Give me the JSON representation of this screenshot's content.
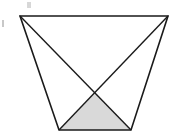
{
  "diagram": {
    "type": "trapezoid-with-diagonals",
    "vertices": {
      "top_left": [
        20,
        16
      ],
      "top_right": [
        168,
        16
      ],
      "bottom_right": [
        131,
        130
      ],
      "bottom_left": [
        59,
        130
      ]
    },
    "diagonal_intersection": [
      95,
      93
    ],
    "shaded_region": "triangle bottom_left - bottom_right - intersection",
    "colors": {
      "stroke": "#1a1a1a",
      "shade": "#d9d9d9",
      "marks": "#b0b0b0"
    },
    "marks": [
      "double-tick mark near top-left",
      "single bar mark at left edge"
    ]
  }
}
